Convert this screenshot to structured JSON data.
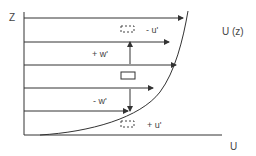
{
  "diagram": {
    "title": "",
    "axes": {
      "vertical_label": "Z",
      "horizontal_label": "U"
    },
    "profile_label": "U (z)",
    "annotations": {
      "top_parcel": "- u'",
      "upward_arrow": "+ w'",
      "downward_arrow": "- w'",
      "bottom_parcel": "+ u'"
    },
    "colors": {
      "line": "#333333",
      "text": "#444444",
      "background": "#ffffff"
    }
  }
}
